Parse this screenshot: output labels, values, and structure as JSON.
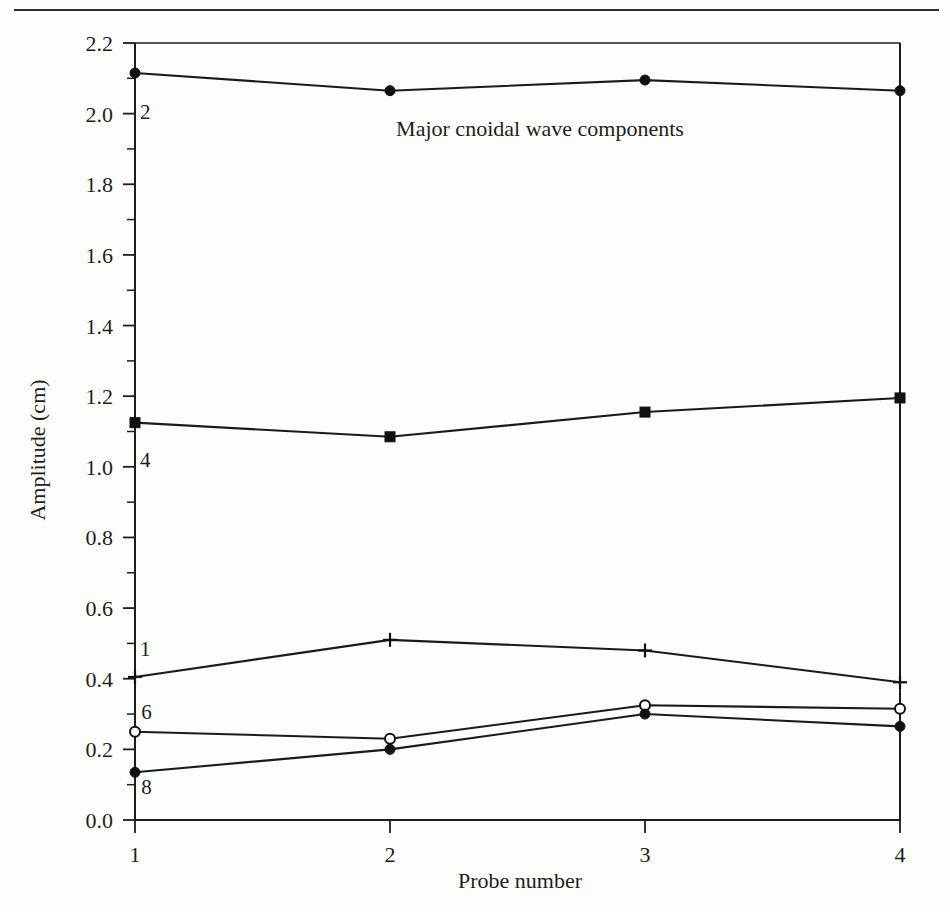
{
  "page": {
    "background_color": "#fdfdfb",
    "rule_color": "#2e2e2e"
  },
  "chart_data": {
    "type": "line",
    "title": "Major cnoidal wave components",
    "xlabel": "Probe number",
    "ylabel": "Amplitude (cm)",
    "x": [
      1,
      2,
      3,
      4
    ],
    "xtick_labels": [
      "1",
      "2",
      "3",
      "4"
    ],
    "xlim": [
      1,
      4
    ],
    "ylim": [
      0.0,
      2.2
    ],
    "ytick_labels": [
      "0.0",
      "0.2",
      "0.4",
      "0.6",
      "0.8",
      "1.0",
      "1.2",
      "1.4",
      "1.6",
      "1.8",
      "2.0",
      "2.2"
    ],
    "ytick_values": [
      0.0,
      0.2,
      0.4,
      0.6,
      0.8,
      1.0,
      1.2,
      1.4,
      1.6,
      1.8,
      2.0,
      2.2
    ],
    "yminor_values": [
      0.1,
      0.3,
      0.5,
      0.7,
      0.9,
      1.1,
      1.3,
      1.5,
      1.7,
      1.9,
      2.1
    ],
    "grid": false,
    "legend": "inline-labels",
    "series": [
      {
        "name": "2",
        "label": "2",
        "marker": "filled-circle",
        "values": [
          2.115,
          2.065,
          2.095,
          2.065
        ],
        "label_x": 1.04,
        "label_y": 1.985
      },
      {
        "name": "4",
        "label": "4",
        "marker": "filled-square",
        "values": [
          1.125,
          1.085,
          1.155,
          1.195
        ],
        "label_x": 1.04,
        "label_y": 1.0
      },
      {
        "name": "1",
        "label": "1",
        "marker": "plus",
        "values": [
          0.405,
          0.51,
          0.48,
          0.39
        ],
        "label_x": 1.04,
        "label_y": 0.465
      },
      {
        "name": "6",
        "label": "6",
        "marker": "open-circle",
        "values": [
          0.25,
          0.23,
          0.325,
          0.315
        ],
        "label_x": 1.045,
        "label_y": 0.285
      },
      {
        "name": "8",
        "label": "8",
        "marker": "filled-circle",
        "values": [
          0.135,
          0.2,
          0.3,
          0.265
        ],
        "label_x": 1.045,
        "label_y": 0.075
      }
    ]
  }
}
